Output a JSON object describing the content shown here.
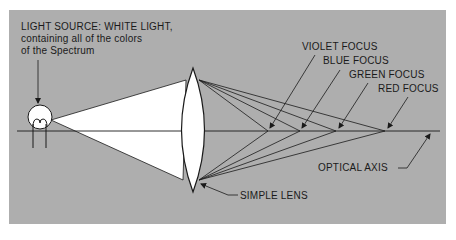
{
  "diagram": {
    "type": "optics",
    "colors": {
      "panel": "#aeaeae",
      "light_cone": "#ffffff",
      "line": "#1a1a1a"
    },
    "labels": {
      "light_source_line1": "LIGHT SOURCE: WHITE LIGHT,",
      "light_source_line2": "containing all of the colors",
      "light_source_line3": "of the Spectrum",
      "violet_focus": "VIOLET FOCUS",
      "blue_focus": "BLUE FOCUS",
      "green_focus": "GREEN FOCUS",
      "red_focus": "RED FOCUS",
      "optical_axis": "OPTICAL AXIS",
      "simple_lens": "SIMPLE LENS"
    },
    "focus_points": [
      {
        "name": "violet",
        "x": 268
      },
      {
        "name": "blue",
        "x": 300
      },
      {
        "name": "green",
        "x": 336
      },
      {
        "name": "red",
        "x": 385
      }
    ]
  }
}
